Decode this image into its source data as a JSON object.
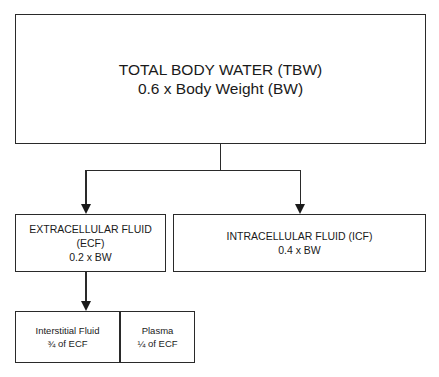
{
  "diagram": {
    "root": {
      "label": "TOTAL BODY WATER (TBW)",
      "formula": "0.6 x Body Weight (BW)"
    },
    "ecf": {
      "label_line1": "EXTRACELLULAR FLUID",
      "label_line2": "(ECF)",
      "formula": "0.2 x BW"
    },
    "icf": {
      "label": "INTRACELLULAR FLUID (ICF)",
      "formula": "0.4 x BW"
    },
    "interstitial": {
      "label": "Interstitial Fluid",
      "fraction": "¾ of ECF"
    },
    "plasma": {
      "label": "Plasma",
      "fraction": "¼ of ECF"
    },
    "colors": {
      "stroke": "#2a2a2a",
      "background": "#ffffff",
      "text": "#1a1a1a"
    }
  }
}
